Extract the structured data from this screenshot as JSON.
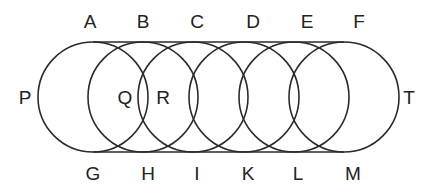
{
  "diagram": {
    "stroke_color": "#2a2a2a",
    "circles": [
      {
        "cx": 93,
        "cy": 97,
        "r": 55
      },
      {
        "cx": 143,
        "cy": 97,
        "r": 55
      },
      {
        "cx": 193,
        "cy": 97,
        "r": 55
      },
      {
        "cx": 244,
        "cy": 97,
        "r": 55
      },
      {
        "cx": 294,
        "cy": 97,
        "r": 55
      },
      {
        "cx": 344,
        "cy": 97,
        "r": 55
      }
    ],
    "top_line": {
      "x1": 93,
      "y1": 42,
      "x2": 344,
      "y2": 42
    },
    "bottom_line": {
      "x1": 93,
      "y1": 152,
      "x2": 344,
      "y2": 152
    },
    "labels": {
      "top": [
        {
          "text": "A",
          "x": 90,
          "y": 28
        },
        {
          "text": "B",
          "x": 143,
          "y": 28
        },
        {
          "text": "C",
          "x": 197,
          "y": 28
        },
        {
          "text": "D",
          "x": 253,
          "y": 28
        },
        {
          "text": "E",
          "x": 307,
          "y": 28
        },
        {
          "text": "F",
          "x": 359,
          "y": 28
        }
      ],
      "bottom": [
        {
          "text": "G",
          "x": 93,
          "y": 180
        },
        {
          "text": "H",
          "x": 148,
          "y": 180
        },
        {
          "text": "I",
          "x": 197,
          "y": 180
        },
        {
          "text": "K",
          "x": 248,
          "y": 180
        },
        {
          "text": "L",
          "x": 298,
          "y": 180
        },
        {
          "text": "M",
          "x": 353,
          "y": 180
        }
      ],
      "left": {
        "text": "P",
        "x": 25,
        "y": 104
      },
      "right": {
        "text": "T",
        "x": 409,
        "y": 104
      },
      "inner": [
        {
          "text": "Q",
          "x": 125,
          "y": 104
        },
        {
          "text": "R",
          "x": 163,
          "y": 104
        }
      ]
    }
  }
}
